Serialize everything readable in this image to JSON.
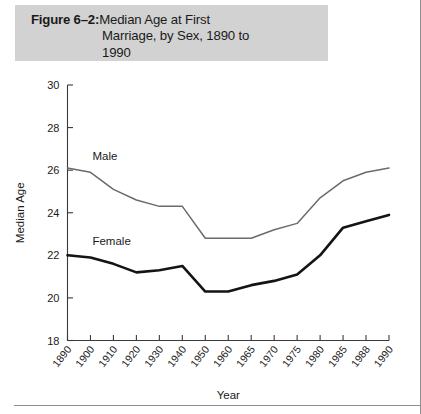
{
  "figure": {
    "label": "Figure 6–2:",
    "title_line1": "Median Age at First",
    "title_line2": "Marriage, by Sex, 1890 to",
    "title_line3": "1990"
  },
  "chart_data": {
    "type": "line",
    "title": "Median Age at First Marriage, by Sex, 1890 to 1990",
    "xlabel": "Year",
    "ylabel": "Median Age",
    "categories": [
      "1890",
      "1900",
      "1910",
      "1920",
      "1930",
      "1940",
      "1950",
      "1960",
      "1965",
      "1970",
      "1975",
      "1980",
      "1985",
      "1988",
      "1990"
    ],
    "ylim": [
      18,
      30
    ],
    "yticks": [
      18,
      20,
      22,
      24,
      26,
      28,
      30
    ],
    "grid": false,
    "legend": "inline-labels",
    "series": [
      {
        "name": "Male",
        "color": "#6b6b6b",
        "label_x": "1900",
        "values": [
          26.1,
          25.9,
          25.1,
          24.6,
          24.3,
          24.3,
          22.8,
          22.8,
          22.8,
          23.2,
          23.5,
          24.7,
          25.5,
          25.9,
          26.1
        ]
      },
      {
        "name": "Female",
        "color": "#141414",
        "label_x": "1900",
        "values": [
          22.0,
          21.9,
          21.6,
          21.2,
          21.3,
          21.5,
          20.3,
          20.3,
          20.6,
          20.8,
          21.1,
          22.0,
          23.3,
          23.6,
          23.9
        ]
      }
    ]
  }
}
